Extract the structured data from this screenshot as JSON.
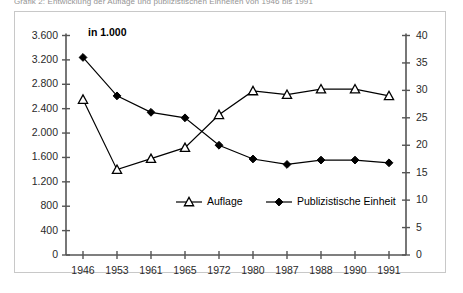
{
  "caption": "Grafik 2: Entwicklung der Auflage und publizistischen Einheiten von 1946 bis 1991",
  "unit_note": "in 1.000",
  "legend": {
    "auflage": "Auflage",
    "einheit": "Publizistische Einheit"
  },
  "colors": {
    "line": "#000000",
    "frame": "#c8c8c8",
    "axis": "#555555",
    "text": "#1a1a1a"
  },
  "chart_data": {
    "type": "line",
    "title": "Grafik 2: Entwicklung der Auflage und publizistischen Einheiten von 1946 bis 1991",
    "subtitle": "in 1.000",
    "xlabel": "",
    "ylabel": "",
    "grid": false,
    "legend_position": "bottom-center",
    "categories": [
      "1946",
      "1953",
      "1961",
      "1965",
      "1972",
      "1980",
      "1987",
      "1988",
      "1990",
      "1991"
    ],
    "x_tick_labels": [
      "1946",
      "1953",
      "1961",
      "1965",
      "1972",
      "1980",
      "1987",
      "1988",
      "1990",
      "1991"
    ],
    "left_axis": {
      "label": "Auflage (in 1.000)",
      "ylim": [
        0,
        3600
      ],
      "ticks": [
        0,
        400,
        800,
        1200,
        1600,
        2000,
        2400,
        2800,
        3200,
        3600
      ],
      "tick_labels": [
        "0",
        "400",
        "800",
        "1.200",
        "1.600",
        "2.000",
        "2.400",
        "2.800",
        "3.200",
        "3.600"
      ]
    },
    "right_axis": {
      "label": "Publizistische Einheit",
      "ylim": [
        0,
        40
      ],
      "ticks": [
        0,
        5,
        10,
        15,
        20,
        25,
        30,
        35,
        40
      ],
      "tick_labels": [
        "0",
        "5",
        "10",
        "15",
        "20",
        "25",
        "30",
        "35",
        "40"
      ]
    },
    "series": [
      {
        "name": "Auflage",
        "axis": "left",
        "marker": "open-triangle",
        "values": [
          2550,
          1400,
          1580,
          1760,
          2300,
          2690,
          2630,
          2720,
          2720,
          2610
        ]
      },
      {
        "name": "Publizistische Einheit",
        "axis": "right",
        "marker": "filled-diamond",
        "values": [
          36,
          29,
          26,
          25,
          20,
          17.5,
          16.5,
          17.3,
          17.3,
          16.8
        ]
      }
    ]
  }
}
